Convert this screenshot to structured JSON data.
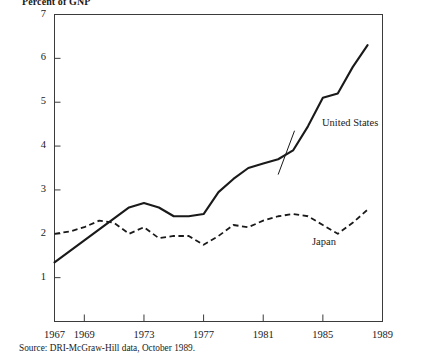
{
  "axis_title": "Percent of GNP",
  "source": "Source: DRI-McGraw-Hill data, October 1989.",
  "labels": {
    "united_states": "United States",
    "japan": "Japan"
  },
  "chart_data": {
    "type": "line",
    "title": "Percent of GNP",
    "xlabel": "",
    "ylabel": "Percent of GNP",
    "xlim": [
      1967,
      1989
    ],
    "ylim": [
      0,
      7
    ],
    "grid": false,
    "legend": "inline-annotation",
    "xticks": [
      1967,
      1969,
      1973,
      1977,
      1981,
      1985,
      1989
    ],
    "xtick_labels": [
      "1967",
      "1969",
      "1973",
      "1977",
      "1981",
      "1985",
      "1989"
    ],
    "yticks": [
      1,
      2,
      3,
      4,
      5,
      6,
      7
    ],
    "ytick_labels": [
      "1",
      "2",
      "3",
      "4",
      "5",
      "6",
      "7"
    ],
    "x": [
      1967,
      1968,
      1969,
      1970,
      1971,
      1972,
      1973,
      1974,
      1975,
      1976,
      1977,
      1978,
      1979,
      1980,
      1981,
      1982,
      1983,
      1984,
      1985,
      1986,
      1987,
      1988
    ],
    "series": [
      {
        "name": "United States",
        "style": "solid",
        "color": "#1a1a1a",
        "values": [
          1.35,
          1.6,
          1.85,
          2.1,
          2.35,
          2.6,
          2.7,
          2.6,
          2.4,
          2.4,
          2.45,
          2.95,
          3.25,
          3.5,
          3.6,
          3.7,
          3.9,
          4.45,
          5.1,
          5.2,
          5.8,
          6.3
        ]
      },
      {
        "name": "Japan",
        "style": "dashed",
        "color": "#1a1a1a",
        "values": [
          2.0,
          2.05,
          2.15,
          2.3,
          2.25,
          2.0,
          2.15,
          1.9,
          1.95,
          1.95,
          1.75,
          1.95,
          2.2,
          2.15,
          2.3,
          2.4,
          2.45,
          2.4,
          2.2,
          2.0,
          2.25,
          2.55
        ]
      }
    ],
    "annotations": [
      {
        "text": "United States",
        "x": 1983.2,
        "y": 4.05
      },
      {
        "text": "Japan",
        "x": 1983.0,
        "y": 1.72
      }
    ]
  }
}
